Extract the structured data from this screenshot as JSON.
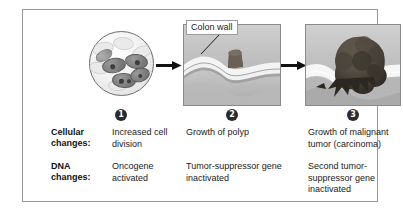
{
  "figure": {
    "frame_color": "#9b9b9b"
  },
  "stages": [
    {
      "number": "1",
      "badge_label": "1",
      "image_name": "dividing-cells-micrograph",
      "cellular_change": "Increased cell division",
      "dna_change": "Oncogene activated"
    },
    {
      "number": "2",
      "badge_label": "2",
      "image_name": "colon-wall-polyp-illustration",
      "callout_label": "Colon wall",
      "cellular_change": "Growth of polyp",
      "dna_change": "Tumor-suppressor gene inactivated"
    },
    {
      "number": "3",
      "badge_label": "3",
      "image_name": "colon-wall-malignant-tumor-illustration",
      "cellular_change": "Growth of malignant tumor (carcinoma)",
      "dna_change": "Second tumor-suppressor gene inactivated"
    }
  ],
  "row_labels": {
    "cellular": "Cellular changes:",
    "cellular_line1": "Cellular",
    "cellular_line2": "changes:",
    "dna": "DNA changes:",
    "dna_line1": "DNA",
    "dna_line2": "changes:"
  },
  "arrows": {
    "arrow1_name": "stage-1-to-2-arrow",
    "arrow2_name": "stage-2-to-3-arrow"
  }
}
